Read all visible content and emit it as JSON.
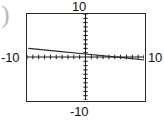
{
  "window": {
    "title": "graphing-calculator-plot"
  },
  "artifact": {
    "brace_glyph": ")"
  },
  "axis_labels": {
    "top": "10",
    "bottom": "-10",
    "left": "-10",
    "right": "10"
  },
  "chart_data": {
    "type": "line",
    "title": "",
    "xlabel": "",
    "ylabel": "",
    "xlim": [
      -10,
      10
    ],
    "ylim": [
      -10,
      10
    ],
    "grid": false,
    "legend": "none",
    "axes": {
      "x_axis_at_y": 0,
      "y_axis_at_x": 0,
      "tick_spacing_x": 1,
      "tick_spacing_y": 1,
      "tick_style": "hash-marks"
    },
    "tick_labels": {
      "x": [
        "-10",
        "10"
      ],
      "y": [
        "-10",
        "10"
      ]
    },
    "series": [
      {
        "name": "line",
        "x": [
          -9.7,
          -5.0,
          0.0,
          5.0,
          7.2,
          10.0
        ],
        "y": [
          2.0,
          1.35,
          0.7,
          0.05,
          -0.25,
          -0.7
        ],
        "color": "#2a2a2a",
        "style": "solid",
        "width": 1.2,
        "description": "slowly decreasing straight line crossing the x-axis near x = 7.4"
      }
    ]
  },
  "colors": {
    "frame": "#2a2a2a",
    "axis": "#1a1a1a",
    "curve": "#2a2a2a",
    "label": "#111111",
    "background": "#ffffff",
    "artifact": "#b9b9b9"
  }
}
